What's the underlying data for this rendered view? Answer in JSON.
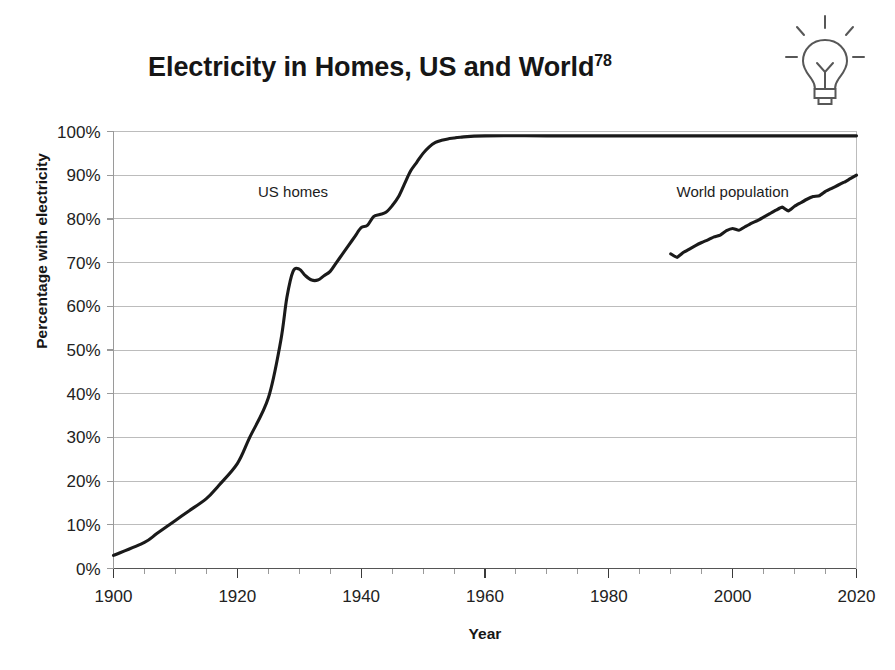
{
  "title": {
    "text": "Electricity in Homes, US and World",
    "superscript": "78"
  },
  "icons": {
    "bulb": "lightbulb-icon"
  },
  "axes": {
    "y_title": "Percentage with electricity",
    "x_title": "Year",
    "y_ticks": [
      "0%",
      "10%",
      "20%",
      "30%",
      "40%",
      "50%",
      "60%",
      "70%",
      "80%",
      "90%",
      "100%"
    ],
    "x_ticks": [
      "1900",
      "1920",
      "1940",
      "1960",
      "1980",
      "2000",
      "2020"
    ]
  },
  "series_labels": {
    "us": "US homes",
    "world": "World population"
  },
  "colors": {
    "line": "#1a1a1a",
    "grid": "#bcbcbc",
    "axis": "#9a9a9a",
    "background": "#ffffff"
  },
  "chart_data": {
    "type": "line",
    "title": "Electricity in Homes, US and World",
    "xlabel": "Year",
    "ylabel": "Percentage with electricity",
    "xlim": [
      1900,
      2020
    ],
    "ylim": [
      0,
      100
    ],
    "xtick_step": 20,
    "xtick_minor_step": 5,
    "ytick_step": 10,
    "grid": true,
    "legend": "inline-labels",
    "units": "percent",
    "series": [
      {
        "name": "US homes",
        "label_position": {
          "x": 1929,
          "y": 85
        },
        "x": [
          1900,
          1905,
          1907,
          1910,
          1912,
          1915,
          1917,
          1920,
          1922,
          1925,
          1927,
          1928,
          1929,
          1930,
          1931,
          1932,
          1933,
          1934,
          1935,
          1936,
          1937,
          1938,
          1939,
          1940,
          1941,
          1942,
          1943,
          1944,
          1945,
          1946,
          1947,
          1948,
          1949,
          1950,
          1951,
          1952,
          1953,
          1954,
          1955,
          1956,
          1960,
          1970,
          1980,
          1990,
          2000,
          2010,
          2020
        ],
        "y": [
          3,
          6,
          8,
          11,
          13,
          16,
          19,
          24,
          30,
          39,
          52,
          62,
          68,
          68.5,
          67,
          66,
          66,
          67,
          68,
          70,
          72,
          74,
          76,
          78,
          78.5,
          80.5,
          81,
          81.5,
          83,
          85,
          88,
          91,
          93,
          95,
          96.5,
          97.5,
          98,
          98.3,
          98.5,
          98.7,
          99,
          99,
          99,
          99,
          99,
          99,
          99
        ]
      },
      {
        "name": "World population",
        "label_position": {
          "x": 2000,
          "y": 85
        },
        "x": [
          1990,
          1991,
          1992,
          1993,
          1994,
          1995,
          1996,
          1997,
          1998,
          1999,
          2000,
          2001,
          2002,
          2003,
          2004,
          2005,
          2006,
          2007,
          2008,
          2009,
          2010,
          2011,
          2012,
          2013,
          2014,
          2015,
          2016,
          2017,
          2018,
          2019,
          2020
        ],
        "y": [
          72,
          71.2,
          72.3,
          73.1,
          73.9,
          74.6,
          75.2,
          75.9,
          76.3,
          77.3,
          77.8,
          77.4,
          78.2,
          79.0,
          79.6,
          80.4,
          81.2,
          82.0,
          82.7,
          81.8,
          82.9,
          83.7,
          84.5,
          85.1,
          85.3,
          86.3,
          87.0,
          87.7,
          88.4,
          89.2,
          90.0
        ]
      }
    ]
  }
}
